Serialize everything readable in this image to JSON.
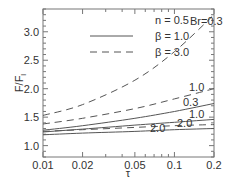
{
  "chart_data": {
    "type": "line",
    "title": "",
    "xlabel": "τ",
    "ylabel": "F/F_l",
    "xscale": "log",
    "xlim": [
      0.01,
      0.2
    ],
    "ylim": [
      0.8,
      3.4
    ],
    "xticks": [
      0.01,
      0.02,
      0.05,
      0.1,
      0.2
    ],
    "xtick_labels": [
      "0.01",
      "0.02",
      "0.05",
      "0.1",
      "0.2"
    ],
    "yticks": [
      1.0,
      1.5,
      2.0,
      2.5,
      3.0
    ],
    "ytick_labels": [
      "1.0",
      "1.5",
      "2.0",
      "2.5",
      "3.0"
    ],
    "grid": false,
    "legend": {
      "position": "upper left",
      "header": "n = 0.5",
      "entries": [
        {
          "label": "β = 1.0",
          "style": "solid"
        },
        {
          "label": "β = 3.0",
          "style": "dashed"
        }
      ]
    },
    "annotations": [
      "Br=0.3",
      "1.0",
      "0.3",
      "1.0",
      "2.0",
      "2.0"
    ],
    "x": [
      0.01,
      0.02,
      0.05,
      0.1,
      0.2
    ],
    "series": [
      {
        "name": "β = 3.0, Br = 0.3",
        "style": "dashed",
        "label": "Br=0.3",
        "values": [
          1.53,
          1.72,
          2.15,
          2.65,
          3.3
        ]
      },
      {
        "name": "β = 3.0, Br = 1.0",
        "style": "dashed",
        "label": "1.0",
        "values": [
          1.38,
          1.48,
          1.65,
          1.82,
          2.0
        ]
      },
      {
        "name": "β = 1.0, Br = 0.3",
        "style": "solid",
        "label": "0.3",
        "values": [
          1.27,
          1.35,
          1.48,
          1.6,
          1.74
        ]
      },
      {
        "name": "β = 1.0, Br = 1.0",
        "style": "solid",
        "label": "1.0",
        "values": [
          1.24,
          1.29,
          1.36,
          1.41,
          1.46
        ]
      },
      {
        "name": "β = 3.0, Br = 2.0",
        "style": "dashed",
        "label": "2.0",
        "values": [
          1.25,
          1.28,
          1.32,
          1.35,
          1.37
        ]
      },
      {
        "name": "β = 1.0, Br = 2.0",
        "style": "solid",
        "label": "2.0",
        "values": [
          1.19,
          1.22,
          1.25,
          1.28,
          1.3
        ]
      }
    ]
  },
  "colors": {
    "line": "#555555",
    "axis": "#777777",
    "text": "#333333"
  }
}
